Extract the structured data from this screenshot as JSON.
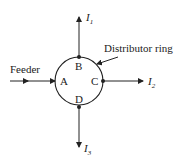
{
  "diagram": {
    "feeder_label": "Feeder",
    "ring_label": "Distributor ring",
    "nodes": [
      {
        "id": "A",
        "label": "A"
      },
      {
        "id": "B",
        "label": "B"
      },
      {
        "id": "C",
        "label": "C"
      },
      {
        "id": "D",
        "label": "D"
      }
    ],
    "loads": [
      {
        "node": "B",
        "label": "I",
        "sub": "1",
        "direction": "up"
      },
      {
        "node": "C",
        "label": "I",
        "sub": "2",
        "direction": "right"
      },
      {
        "node": "D",
        "label": "I",
        "sub": "3",
        "direction": "down"
      }
    ],
    "colors": {
      "stroke": "#222222",
      "background": "#ffffff"
    }
  }
}
